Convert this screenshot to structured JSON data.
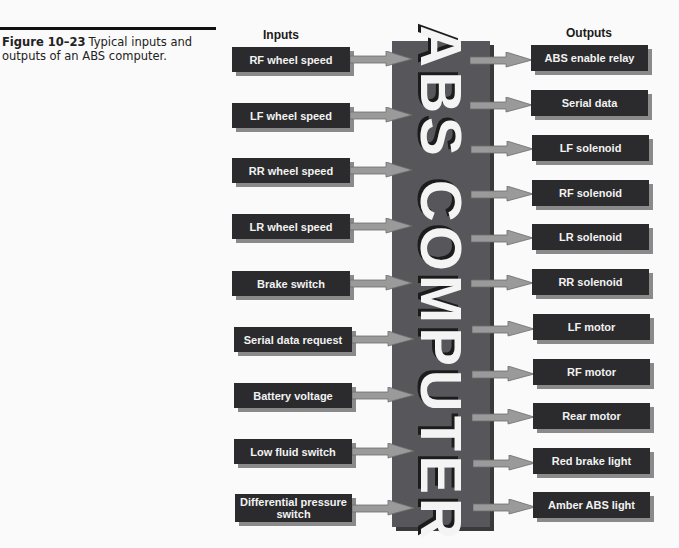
{
  "caption": {
    "figure_number": "Figure 10–23",
    "text": "Typical inputs and outputs of an ABS computer."
  },
  "headers": {
    "inputs": "Inputs",
    "outputs": "Outputs"
  },
  "computer": {
    "label": "ABS COMPUTER"
  },
  "inputs": [
    {
      "label": "RF wheel speed"
    },
    {
      "label": "LF wheel speed"
    },
    {
      "label": "RR wheel speed"
    },
    {
      "label": "LR wheel speed"
    },
    {
      "label": "Brake switch"
    },
    {
      "label": "Serial data request"
    },
    {
      "label": "Battery voltage"
    },
    {
      "label": "Low fluid switch"
    },
    {
      "label": "Differential pressure switch"
    }
  ],
  "outputs": [
    {
      "label": "ABS enable relay"
    },
    {
      "label": "Serial data"
    },
    {
      "label": "LF solenoid"
    },
    {
      "label": "RF solenoid"
    },
    {
      "label": "LR solenoid"
    },
    {
      "label": "RR solenoid"
    },
    {
      "label": "LF motor"
    },
    {
      "label": "RF motor"
    },
    {
      "label": "Rear motor"
    },
    {
      "label": "Red brake light"
    },
    {
      "label": "Amber ABS light"
    }
  ],
  "colors": {
    "box_fill": "#2b2b2d",
    "box_shadow": "#8a8a8a",
    "computer_fill": "#57575b",
    "arrow_fill": "#9a9a9a",
    "text_light": "#f2f2f2"
  }
}
